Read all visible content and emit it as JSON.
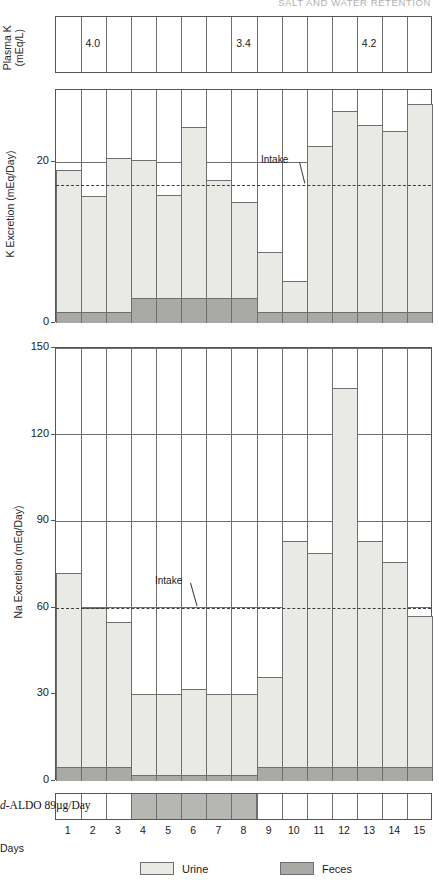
{
  "running_head": "SALT AND WATER RETENTION",
  "days": [
    1,
    2,
    3,
    4,
    5,
    6,
    7,
    8,
    9,
    10,
    11,
    12,
    13,
    14,
    15
  ],
  "days_axis_label": "Days",
  "plasma_k": {
    "ylabel_line1": "Plasma K",
    "ylabel_line2": "(mEq/L)",
    "values": [
      {
        "day": 2,
        "text": "4.0"
      },
      {
        "day": 8,
        "text": "3.4"
      },
      {
        "day": 13,
        "text": "4.2"
      }
    ]
  },
  "treatment": {
    "label_prefix": "d",
    "label_rest": "-ALDO 89µg/Day",
    "start_day": 4,
    "end_day": 8
  },
  "legend": {
    "items": [
      {
        "name": "urine",
        "label": "Urine",
        "color": "#e9e9e5"
      },
      {
        "name": "feces",
        "label": "Feces",
        "color": "#a9a9a6"
      }
    ]
  },
  "chart_data": [
    {
      "type": "bar",
      "id": "k-excretion",
      "title": "",
      "ylabel": "K Excretion (mEq/Day)",
      "xlabel": "Days",
      "categories": [
        1,
        2,
        3,
        4,
        5,
        6,
        7,
        8,
        9,
        10,
        11,
        12,
        13,
        14,
        15
      ],
      "ylim": [
        0,
        29
      ],
      "yticks": [
        0,
        20
      ],
      "ytick_labels": [
        "0",
        "20"
      ],
      "grid": true,
      "stacked": true,
      "annotation_intake": {
        "label": "Intake",
        "value": 17.2
      },
      "series": [
        {
          "name": "Urine",
          "color": "#e9e9e5",
          "values": [
            17.6,
            14.4,
            19.1,
            17.2,
            12.8,
            21.3,
            14.7,
            11.9,
            7.4,
            3.8,
            20.6,
            25.0,
            23.3,
            22.5,
            25.8
          ]
        },
        {
          "name": "Feces",
          "color": "#a9a9a6",
          "values": [
            1.4,
            1.4,
            1.4,
            3.1,
            3.1,
            3.1,
            3.1,
            3.1,
            1.4,
            1.4,
            1.4,
            1.4,
            1.4,
            1.4,
            1.4
          ]
        }
      ],
      "totals": [
        19.0,
        15.8,
        20.5,
        20.3,
        15.9,
        24.4,
        17.8,
        15.0,
        8.8,
        5.2,
        22.0,
        26.4,
        24.7,
        23.9,
        27.2
      ]
    },
    {
      "type": "bar",
      "id": "na-excretion",
      "title": "",
      "ylabel": "Na Excretion (mEq/Day)",
      "xlabel": "Days",
      "categories": [
        1,
        2,
        3,
        4,
        5,
        6,
        7,
        8,
        9,
        10,
        11,
        12,
        13,
        14,
        15
      ],
      "ylim": [
        0,
        150
      ],
      "yticks": [
        0,
        30,
        60,
        90,
        120,
        150
      ],
      "ytick_labels": [
        "0",
        "30",
        "60",
        "90",
        "120",
        "150"
      ],
      "grid": true,
      "stacked": true,
      "annotation_intake": {
        "label": "Intake",
        "value": 60
      },
      "series": [
        {
          "name": "Urine",
          "color": "#e9e9e5",
          "values": [
            67,
            55,
            50,
            28,
            28,
            30,
            28,
            28,
            31,
            78,
            74,
            131,
            78,
            71,
            52
          ]
        },
        {
          "name": "Feces",
          "color": "#a9a9a6",
          "values": [
            5,
            5,
            5,
            2,
            2,
            2,
            2,
            2,
            5,
            5,
            5,
            5,
            5,
            5,
            5
          ]
        }
      ],
      "totals": [
        72,
        60,
        55,
        30,
        30,
        32,
        30,
        30,
        36,
        83,
        79,
        136,
        83,
        76,
        57
      ]
    }
  ]
}
